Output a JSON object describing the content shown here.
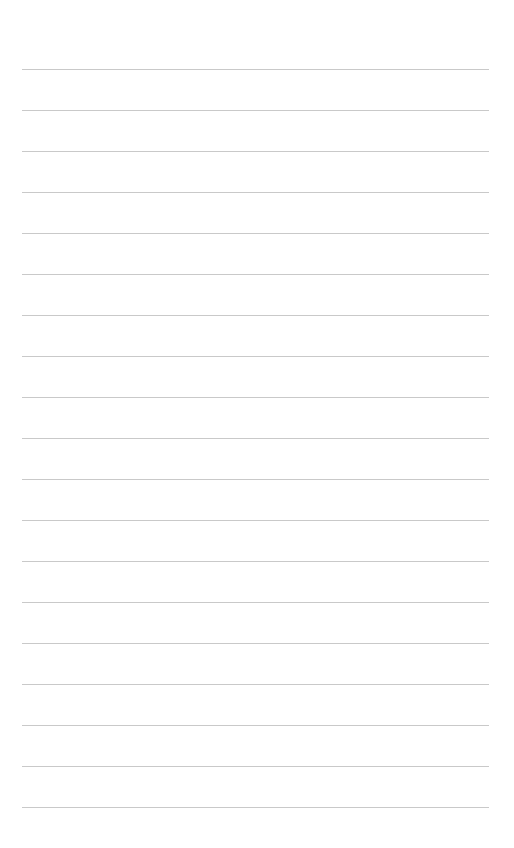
{
  "page": {
    "type": "lined-paper",
    "background_color": "#ffffff",
    "rule_color": "#c9c9c9",
    "rule_left": 22,
    "rule_right": 489,
    "first_rule_y": 69,
    "rule_spacing": 41,
    "rule_count": 19
  }
}
